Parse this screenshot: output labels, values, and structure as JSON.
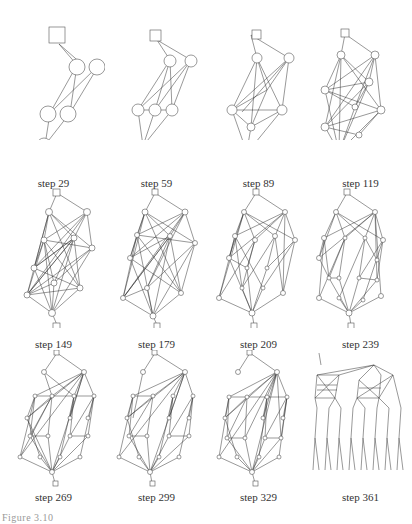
{
  "figure": {
    "panels": [
      {
        "label": "step 29"
      },
      {
        "label": "step 59"
      },
      {
        "label": "step 89"
      },
      {
        "label": "step 119"
      },
      {
        "label": "step 149"
      },
      {
        "label": "step 179"
      },
      {
        "label": "step 209"
      },
      {
        "label": "step 239"
      },
      {
        "label": "step 269"
      },
      {
        "label": "step 299"
      },
      {
        "label": "step 329"
      },
      {
        "label": "step 361"
      }
    ],
    "caption": "Figure 3.10"
  }
}
